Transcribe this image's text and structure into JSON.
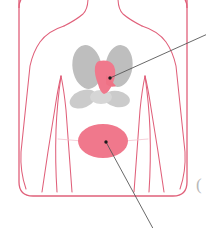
{
  "figure": {
    "title": "Anterior torso anatomy diagram",
    "description": "Front view outline of a human torso with arms at the sides, showing the lungs in gray, the heart highlighted in pink within the thorax, and a highlighted pink oval organ region in the abdomen. Two thin gray leader lines point outward from the heart and the abdominal region toward off-image labels.",
    "view": "anterior",
    "width": 206,
    "height": 228
  },
  "colors": {
    "background": "#ffffff",
    "body_outline": "#e0607a",
    "frame_outline": "#e0607a",
    "organ_gray": "#bebebe",
    "organ_gray_light": "#cfcfcf",
    "highlight_pink": "#f0788c",
    "highlight_pink_dark": "#e8647c",
    "leader_line": "#585858",
    "leader_dot": "#1a1a1a"
  },
  "frame": {
    "name": "rounded panel border",
    "corner_radius": 14,
    "stroke_width": 1.2
  },
  "body": {
    "name": "torso outline",
    "parts": [
      {
        "id": "neck-left",
        "label": "left neck line"
      },
      {
        "id": "neck-right",
        "label": "right neck line"
      },
      {
        "id": "shoulder-left",
        "label": "left shoulder"
      },
      {
        "id": "shoulder-right",
        "label": "right shoulder"
      },
      {
        "id": "arm-left",
        "label": "left arm"
      },
      {
        "id": "arm-right",
        "label": "right arm"
      },
      {
        "id": "flank-left",
        "label": "left flank"
      },
      {
        "id": "flank-right",
        "label": "right flank"
      },
      {
        "id": "waist",
        "label": "waist line"
      }
    ]
  },
  "organs": [
    {
      "id": "lung-right-upper",
      "label": "right lung upper lobe",
      "color_key": "organ_gray",
      "highlighted": false
    },
    {
      "id": "lung-left-upper",
      "label": "left lung upper lobe",
      "color_key": "organ_gray",
      "highlighted": false
    },
    {
      "id": "lung-right-lower",
      "label": "right lung lower lobe",
      "color_key": "organ_gray_light",
      "highlighted": false
    },
    {
      "id": "lung-left-lower",
      "label": "left lung lower lobe",
      "color_key": "organ_gray_light",
      "highlighted": false
    },
    {
      "id": "heart",
      "label": "heart",
      "color_key": "highlight_pink",
      "highlighted": true
    },
    {
      "id": "abdominal-organ",
      "label": "abdominal organ region",
      "color_key": "highlight_pink",
      "highlighted": true
    }
  ],
  "callouts": [
    {
      "id": "callout-heart",
      "label": "heart callout",
      "anchor_organ": "heart",
      "start_x": 110,
      "start_y": 78,
      "end_x": 206,
      "end_y": 35,
      "direction": "upper-right",
      "has_dot": true,
      "text": ""
    },
    {
      "id": "callout-abdomen",
      "label": "abdominal organ callout",
      "anchor_organ": "abdominal-organ",
      "start_x": 106,
      "start_y": 142,
      "end_x": 152,
      "end_y": 228,
      "direction": "lower-right",
      "has_dot": true,
      "text": ""
    }
  ],
  "edge_marks": [
    {
      "id": "cropped-glyph-right",
      "label": "cropped glyph at right edge",
      "text": "(",
      "x": 196,
      "y": 186
    }
  ]
}
